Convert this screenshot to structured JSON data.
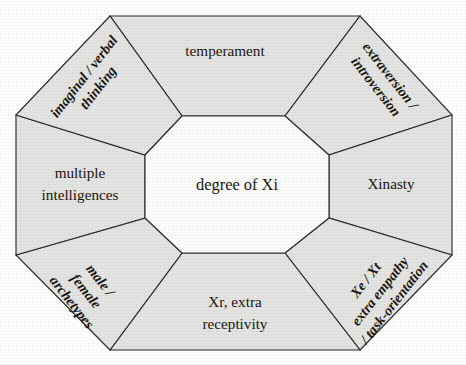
{
  "diagram": {
    "center": {
      "label": "degree of Xi"
    },
    "colors": {
      "segment_fill": "#e4e4e2",
      "core_fill": "#fdfdfc",
      "stroke": "#2b2b2b",
      "text": "#17140f",
      "background": "#ffffff"
    },
    "segments": [
      {
        "id": "top",
        "position": "top",
        "orientation": "horizontal",
        "lines": [
          "temperament"
        ]
      },
      {
        "id": "top-right",
        "position": "top-right",
        "orientation": "diagonal-down",
        "lines": [
          "extraversion /",
          "introversion"
        ]
      },
      {
        "id": "right",
        "position": "right",
        "orientation": "horizontal",
        "lines": [
          "Xinasty"
        ]
      },
      {
        "id": "bottom-right",
        "position": "bottom-right",
        "orientation": "diagonal-up",
        "lines": [
          "Xe / Xt",
          "extra empathy",
          "/ task-orientation"
        ]
      },
      {
        "id": "bottom",
        "position": "bottom",
        "orientation": "horizontal",
        "lines": [
          "Xr, extra",
          "receptivity"
        ]
      },
      {
        "id": "bottom-left",
        "position": "bottom-left",
        "orientation": "diagonal-down",
        "lines": [
          "male /",
          "female",
          "archetypes"
        ]
      },
      {
        "id": "left",
        "position": "left",
        "orientation": "horizontal",
        "lines": [
          "multiple",
          "intelligences"
        ]
      },
      {
        "id": "top-left",
        "position": "top-left",
        "orientation": "diagonal-up",
        "lines": [
          "imaginal / verbal",
          "thinking"
        ]
      }
    ]
  }
}
